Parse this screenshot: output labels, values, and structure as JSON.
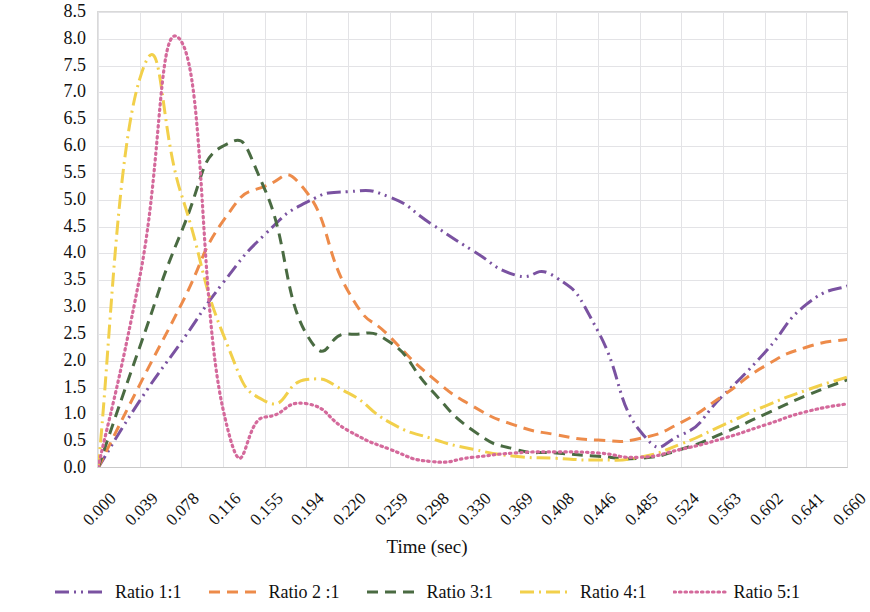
{
  "chart_data": {
    "type": "line",
    "title": "",
    "xlabel": "Time (sec)",
    "ylabel": "Body's forward velocity (cm/sec)",
    "xlim": [
      0,
      18
    ],
    "ylim": [
      0.0,
      8.5
    ],
    "ytick_step": 0.5,
    "grid": true,
    "legend_position": "bottom",
    "categories": [
      "0.000",
      "0.039",
      "0.078",
      "0.116",
      "0.155",
      "0.194",
      "0.220",
      "0.259",
      "0.298",
      "0.330",
      "0.369",
      "0.408",
      "0.446",
      "0.485",
      "0.524",
      "0.563",
      "0.602",
      "0.641",
      "0.660"
    ],
    "ytick_labels": [
      "8.5",
      "8.0",
      "7.5",
      "7.0",
      "6.5",
      "6.0",
      "5.5",
      "5.0",
      "4.5",
      "4.0",
      "3.5",
      "3.0",
      "2.5",
      "2.0",
      "1.5",
      "1.0",
      "0.5",
      "0.0"
    ],
    "series": [
      {
        "name": "Ratio 1:1",
        "color": "#7A52A1",
        "dash": "dashdotdot",
        "values": [
          0.0,
          1.25,
          2.35,
          3.45,
          4.35,
          4.95,
          5.15,
          5.05,
          4.55,
          4.05,
          3.6,
          3.55,
          2.55,
          0.7,
          0.62,
          1.35,
          2.15,
          3.05,
          3.4
        ]
      },
      {
        "name": "Ratio 2 :1",
        "color": "#ED8B4A",
        "dash": "dashed",
        "values": [
          0.0,
          1.55,
          3.05,
          4.6,
          5.25,
          5.15,
          3.3,
          2.45,
          1.7,
          1.15,
          0.8,
          0.62,
          0.52,
          0.55,
          0.85,
          1.35,
          1.9,
          2.25,
          2.4
        ]
      },
      {
        "name": "Ratio 3:1",
        "color": "#4A6B42",
        "dash": "dashed",
        "values": [
          0.0,
          2.25,
          4.4,
          6.0,
          5.2,
          2.5,
          2.5,
          2.35,
          1.45,
          0.7,
          0.35,
          0.28,
          0.22,
          0.18,
          0.35,
          0.65,
          1.0,
          1.35,
          1.65
        ]
      },
      {
        "name": "Ratio 4:1",
        "color": "#F2D04B",
        "dash": "dashdot",
        "values": [
          0.0,
          7.25,
          5.1,
          2.5,
          1.25,
          1.65,
          1.4,
          0.85,
          0.55,
          0.35,
          0.22,
          0.18,
          0.15,
          0.2,
          0.45,
          0.8,
          1.15,
          1.45,
          1.7
        ]
      },
      {
        "name": "Ratio 5:1",
        "color": "#D4699B",
        "dash": "dotted",
        "values": [
          0.0,
          3.55,
          7.95,
          1.1,
          0.95,
          1.2,
          0.7,
          0.35,
          0.12,
          0.2,
          0.28,
          0.3,
          0.28,
          0.2,
          0.35,
          0.55,
          0.8,
          1.05,
          1.2
        ]
      }
    ]
  },
  "legend": {
    "items": [
      {
        "label": "Ratio 1:1"
      },
      {
        "label": "Ratio 2 :1"
      },
      {
        "label": "Ratio 3:1"
      },
      {
        "label": "Ratio 4:1"
      },
      {
        "label": "Ratio 5:1"
      }
    ]
  }
}
